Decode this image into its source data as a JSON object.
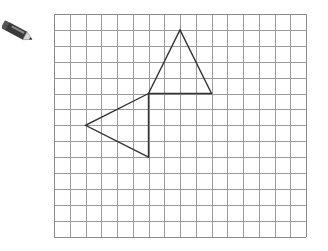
{
  "tool": {
    "icon": "pencil-icon",
    "colors": {
      "body": "#3a3a3a",
      "band": "#8a8a8a",
      "tip": "#d9d9d9",
      "lead": "#222222"
    }
  },
  "grid": {
    "columns": 16,
    "rows": 14,
    "origin_px": [
      54,
      14
    ],
    "cell_w": 15.75,
    "cell_h": 15.9,
    "line_color": "#9a9a9a",
    "border_color": "#8a8a8a"
  },
  "shapes": {
    "stroke_color": "#333333",
    "stroke_width": 1.4,
    "triangles": [
      {
        "name": "upper-triangle",
        "vertices": [
          [
            6,
            5
          ],
          [
            8,
            1
          ],
          [
            10,
            5
          ]
        ]
      },
      {
        "name": "left-triangle",
        "vertices": [
          [
            6,
            5
          ],
          [
            2,
            7
          ],
          [
            6,
            9
          ]
        ]
      }
    ]
  }
}
